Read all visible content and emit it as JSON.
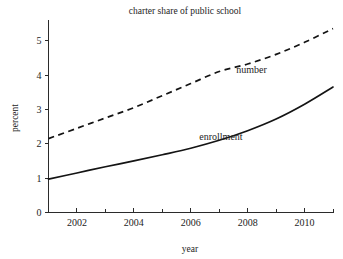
{
  "chart_data": {
    "type": "line",
    "title": "charter share of public school",
    "xlabel": "year",
    "ylabel": "percent",
    "xlim": [
      2001,
      2011
    ],
    "ylim": [
      0,
      5.6
    ],
    "grid": false,
    "legend_position": "inline-annotation",
    "x": [
      2001,
      2002,
      2003,
      2004,
      2005,
      2006,
      2007,
      2008,
      2009,
      2010,
      2011
    ],
    "xticks": [
      2002,
      2004,
      2006,
      2008,
      2010
    ],
    "xtick_labels": [
      "2002",
      "2004",
      "2006",
      "2008",
      "2010"
    ],
    "xminor_ticks": [
      2001,
      2003,
      2005,
      2007,
      2009,
      2011
    ],
    "yticks": [
      0,
      1,
      2,
      3,
      4,
      5
    ],
    "ytick_labels": [
      "0",
      "1",
      "2",
      "3",
      "4",
      "5"
    ],
    "series": [
      {
        "name": "number",
        "style": "dashed",
        "label": "number",
        "values": [
          2.15,
          2.45,
          2.75,
          3.05,
          3.4,
          3.75,
          4.1,
          4.32,
          4.6,
          4.95,
          5.35
        ]
      },
      {
        "name": "enrollment",
        "style": "solid",
        "label": "enrollment",
        "values": [
          0.97,
          1.15,
          1.33,
          1.5,
          1.68,
          1.87,
          2.1,
          2.38,
          2.72,
          3.15,
          3.65
        ]
      }
    ],
    "annotations": [
      {
        "text": "number",
        "x": 2007.6,
        "y": 4.05
      },
      {
        "text": "enrollment",
        "x": 2006.3,
        "y": 2.12
      }
    ]
  }
}
